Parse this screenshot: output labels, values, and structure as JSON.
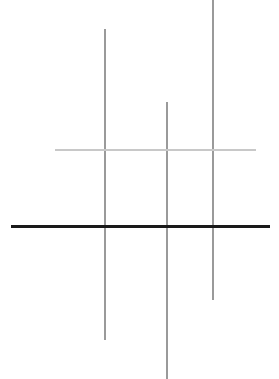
{
  "figure": {
    "canvas": {
      "width": 279,
      "height": 379,
      "background": "#ffffff"
    }
  },
  "chart_data": {
    "type": "line",
    "title": "",
    "subtitle": "",
    "xlabel": "",
    "ylabel": "",
    "grid": false,
    "legend": "none",
    "xlim": [
      0,
      279
    ],
    "ylim": [
      0,
      379
    ],
    "annotations": [],
    "tick_labels": {
      "x": [],
      "y": []
    },
    "series": [
      {
        "name": "vertical-1",
        "orientation": "vertical",
        "x": [
          105,
          105
        ],
        "y": [
          29,
          340
        ],
        "color": "#9a9a9a",
        "width": 2,
        "length": 311
      },
      {
        "name": "vertical-2",
        "orientation": "vertical",
        "x": [
          167,
          167
        ],
        "y": [
          102,
          379
        ],
        "color": "#9a9a9a",
        "width": 2,
        "length": 277
      },
      {
        "name": "vertical-3",
        "orientation": "vertical",
        "x": [
          213,
          213
        ],
        "y": [
          0,
          300
        ],
        "color": "#9a9a9a",
        "width": 2,
        "length": 300
      },
      {
        "name": "horizontal-light",
        "orientation": "horizontal",
        "x": [
          55,
          256
        ],
        "y": [
          150,
          150
        ],
        "color": "#c8c8c8",
        "width": 2,
        "length": 201
      },
      {
        "name": "horizontal-dark",
        "orientation": "horizontal",
        "x": [
          11,
          270
        ],
        "y": [
          226,
          226
        ],
        "color": "#1a1a1a",
        "width": 3,
        "length": 259
      }
    ],
    "intersections": [
      {
        "name": "v1-x-light",
        "x": 105,
        "y": 150
      },
      {
        "name": "v2-x-light",
        "x": 167,
        "y": 150
      },
      {
        "name": "v3-x-light",
        "x": 213,
        "y": 150
      },
      {
        "name": "v1-x-dark",
        "x": 105,
        "y": 226
      },
      {
        "name": "v2-x-dark",
        "x": 167,
        "y": 226
      },
      {
        "name": "v3-x-dark",
        "x": 213,
        "y": 226
      }
    ]
  }
}
